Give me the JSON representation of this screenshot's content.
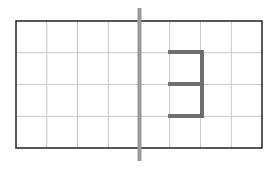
{
  "diagram": {
    "grid": {
      "x": 16,
      "y": 21,
      "width": 246,
      "height": 127,
      "columns": 8,
      "rows": 4,
      "border_color": "#222222",
      "line_color": "#c8c8c8"
    },
    "symmetry_axis": {
      "x": 139.5,
      "y1": 8,
      "y2": 161,
      "color": "#9a9a9a",
      "width": 4
    },
    "figure": {
      "label": "3-shape",
      "color": "#6e6e6e",
      "width": 4,
      "segments": [
        [
          170,
          52,
          202,
          52
        ],
        [
          202,
          52,
          202,
          116
        ],
        [
          170,
          84,
          202,
          84
        ],
        [
          170,
          116,
          202,
          116
        ]
      ]
    }
  }
}
